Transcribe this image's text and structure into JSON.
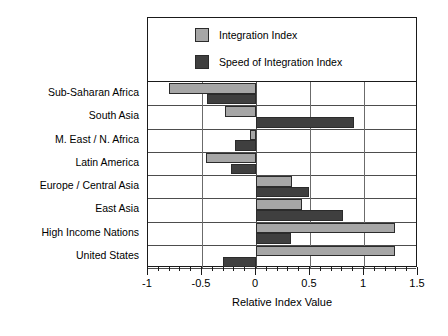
{
  "chart_data": {
    "type": "bar",
    "orientation": "horizontal",
    "title": "",
    "xlabel": "Relative Index Value",
    "ylabel": "",
    "xlim": [
      -1,
      1.5
    ],
    "xticks": [
      -1,
      -0.5,
      0,
      0.5,
      1,
      1.5
    ],
    "xticklabels": [
      "-1",
      "-0.5",
      "0",
      "0.5",
      "1",
      "1.5"
    ],
    "minor_tick_step": 0.1,
    "grid": "horizontal row separators and vertical major gridlines",
    "legend_position": "top-inside-plot",
    "categories": [
      "Sub-Saharan Africa",
      "South Asia",
      "M. East / N. Africa",
      "Latin America",
      "Europe / Central Asia",
      "East Asia",
      "High Income Nations",
      "United States"
    ],
    "series": [
      {
        "name": "Integration Index",
        "color": "#a6a6a6",
        "values": [
          -0.81,
          -0.29,
          -0.06,
          0.46,
          0.33,
          0.43,
          1.29,
          1.29
        ]
      },
      {
        "name": "Speed of Integration Index",
        "color": "#3f3f3f",
        "values": [
          -0.45,
          0.91,
          -0.19,
          -0.23,
          0.49,
          0.81,
          0.32,
          -0.31
        ]
      }
    ],
    "series_corrections": {
      "note": "Integration Index for Latin America is negative",
      "Latin America": -0.46
    }
  },
  "legend": {
    "items": [
      {
        "label": "Integration Index",
        "color": "#a6a6a6"
      },
      {
        "label": "Speed of Integration Index",
        "color": "#3f3f3f"
      }
    ]
  },
  "axis": {
    "x_title": "Relative Index Value"
  }
}
